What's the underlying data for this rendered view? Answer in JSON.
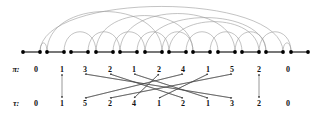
{
  "figure": {
    "type": "permutation-arc-diagram",
    "background": "#ffffff",
    "colors": {
      "node": "#000000",
      "chord_segment": "#555555",
      "arc": "#9a9a9a",
      "arrow": "#444444",
      "text": "#111111"
    }
  },
  "rows": {
    "pi": {
      "label": "π:",
      "label_x": 16,
      "y": 69
    },
    "tau": {
      "label": "τ:",
      "label_x": 16,
      "y": 103
    }
  },
  "chart_data": {
    "type": "diagram",
    "title": "",
    "node_row": {
      "y": 52,
      "count": 22,
      "x_positions": [
        23,
        40,
        47,
        64,
        71,
        88,
        96,
        113,
        120,
        137,
        145,
        162,
        169,
        186,
        193,
        210,
        218,
        235,
        242,
        259,
        266,
        283,
        291,
        308
      ],
      "pair_segments": [
        [
          23,
          40
        ],
        [
          47,
          64
        ],
        [
          71,
          88
        ],
        [
          96,
          113
        ],
        [
          120,
          137
        ],
        [
          145,
          162
        ],
        [
          169,
          186
        ],
        [
          193,
          210
        ],
        [
          218,
          235
        ],
        [
          242,
          259
        ],
        [
          266,
          283
        ],
        [
          291,
          308
        ]
      ]
    },
    "arcs": [
      {
        "from": 40,
        "to": 47,
        "height": 9
      },
      {
        "from": 64,
        "to": 96,
        "height": 20
      },
      {
        "from": 88,
        "to": 120,
        "height": 20
      },
      {
        "from": 113,
        "to": 145,
        "height": 20
      },
      {
        "from": 137,
        "to": 169,
        "height": 20
      },
      {
        "from": 162,
        "to": 193,
        "height": 20
      },
      {
        "from": 186,
        "to": 218,
        "height": 20
      },
      {
        "from": 210,
        "to": 242,
        "height": 20
      },
      {
        "from": 235,
        "to": 266,
        "height": 20
      },
      {
        "from": 259,
        "to": 291,
        "height": 20
      },
      {
        "from": 283,
        "to": 291,
        "height": 9
      },
      {
        "from": 47,
        "to": 162,
        "height": 40
      },
      {
        "from": 96,
        "to": 193,
        "height": 36
      },
      {
        "from": 120,
        "to": 235,
        "height": 38
      },
      {
        "from": 145,
        "to": 266,
        "height": 34
      },
      {
        "from": 169,
        "to": 259,
        "height": 30
      },
      {
        "from": 40,
        "to": 283,
        "height": 45
      }
    ],
    "pi_values": [
      "0",
      "1",
      "3",
      "2",
      "1",
      "2",
      "4",
      "1",
      "5",
      "2",
      "0"
    ],
    "tau_values": [
      "0",
      "1",
      "5",
      "2",
      "4",
      "1",
      "2",
      "1",
      "3",
      "2",
      "0"
    ],
    "column_x": [
      36,
      62,
      85,
      110,
      134,
      159,
      183,
      208,
      232,
      259,
      288
    ],
    "mapping_arrows": [
      {
        "from_col": 1,
        "to_col": 1,
        "double": true
      },
      {
        "from_col": 2,
        "to_col": 8
      },
      {
        "from_col": 3,
        "to_col": 6
      },
      {
        "from_col": 4,
        "to_col": 7
      },
      {
        "from_col": 5,
        "to_col": 4
      },
      {
        "from_col": 6,
        "to_col": 2
      },
      {
        "from_col": 7,
        "to_col": 5
      },
      {
        "from_col": 8,
        "to_col": 3
      },
      {
        "from_col": 9,
        "to_col": 9,
        "double": true
      }
    ]
  }
}
